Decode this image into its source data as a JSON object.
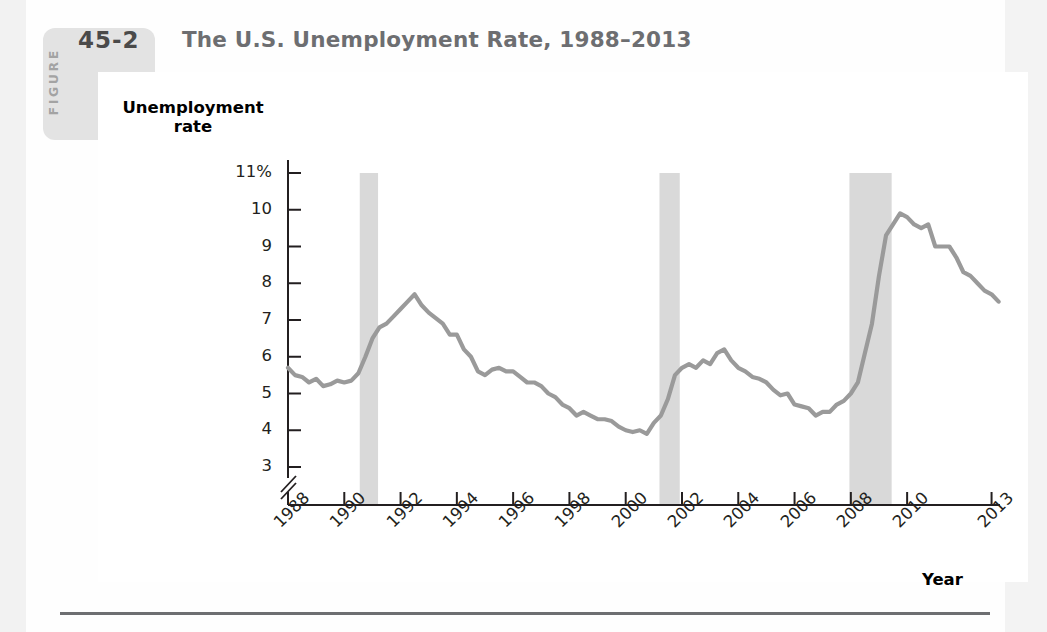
{
  "figure": {
    "label_word": "FIGURE",
    "number": "45-2",
    "title": "The U.S. Unemployment Rate, 1988–2013"
  },
  "chart_data": {
    "type": "line",
    "title": "The U.S. Unemployment Rate, 1988–2013",
    "xlabel": "Year",
    "ylabel": "Unemployment rate",
    "ylabel_lines": [
      "Unemployment",
      "rate"
    ],
    "grid": false,
    "legend": null,
    "axis_break_y": true,
    "ylim": [
      2.6,
      11.4
    ],
    "xlim": [
      1988.0,
      2013.3
    ],
    "yticks": [
      11,
      10,
      9,
      8,
      7,
      6,
      5,
      4,
      3
    ],
    "ytick_labels": [
      "11%",
      "10",
      "9",
      "8",
      "7",
      "6",
      "5",
      "4",
      "3"
    ],
    "xticks": [
      1988,
      1990,
      1992,
      1994,
      1996,
      1998,
      2000,
      2002,
      2004,
      2006,
      2008,
      2010,
      2013
    ],
    "xtick_labels": [
      "1988",
      "1990",
      "1992",
      "1994",
      "1996",
      "1998",
      "2000",
      "2002",
      "2004",
      "2006",
      "2008",
      "2010",
      "2013"
    ],
    "line_color": "#9a9a9a",
    "recession_band_color": "#d9d9d9",
    "recession_bands": [
      {
        "start": 1990.55,
        "end": 1991.2,
        "name": "1990-91 recession"
      },
      {
        "start": 2001.2,
        "end": 2001.92,
        "name": "2001 recession"
      },
      {
        "start": 2007.95,
        "end": 2009.45,
        "name": "2008-09 recession"
      }
    ],
    "series": [
      {
        "name": "U.S. unemployment rate",
        "x": [
          1988.0,
          1988.25,
          1988.5,
          1988.75,
          1989.0,
          1989.25,
          1989.5,
          1989.75,
          1990.0,
          1990.25,
          1990.5,
          1990.75,
          1991.0,
          1991.25,
          1991.5,
          1991.75,
          1992.0,
          1992.25,
          1992.5,
          1992.75,
          1993.0,
          1993.25,
          1993.5,
          1993.75,
          1994.0,
          1994.25,
          1994.5,
          1994.75,
          1995.0,
          1995.25,
          1995.5,
          1995.75,
          1996.0,
          1996.25,
          1996.5,
          1996.75,
          1997.0,
          1997.25,
          1997.5,
          1997.75,
          1998.0,
          1998.25,
          1998.5,
          1998.75,
          1999.0,
          1999.25,
          1999.5,
          1999.75,
          2000.0,
          2000.25,
          2000.5,
          2000.75,
          2001.0,
          2001.25,
          2001.5,
          2001.75,
          2002.0,
          2002.25,
          2002.5,
          2002.75,
          2003.0,
          2003.25,
          2003.5,
          2003.75,
          2004.0,
          2004.25,
          2004.5,
          2004.75,
          2005.0,
          2005.25,
          2005.5,
          2005.75,
          2006.0,
          2006.25,
          2006.5,
          2006.75,
          2007.0,
          2007.25,
          2007.5,
          2007.75,
          2008.0,
          2008.25,
          2008.5,
          2008.75,
          2009.0,
          2009.25,
          2009.5,
          2009.75,
          2010.0,
          2010.25,
          2010.5,
          2010.75,
          2011.0,
          2011.25,
          2011.5,
          2011.75,
          2012.0,
          2012.25,
          2012.5,
          2012.75,
          2013.0,
          2013.25
        ],
        "values": [
          5.7,
          5.5,
          5.45,
          5.3,
          5.4,
          5.2,
          5.25,
          5.35,
          5.3,
          5.35,
          5.55,
          6.0,
          6.5,
          6.8,
          6.9,
          7.1,
          7.3,
          7.5,
          7.7,
          7.4,
          7.2,
          7.05,
          6.9,
          6.6,
          6.6,
          6.2,
          6.0,
          5.6,
          5.5,
          5.65,
          5.7,
          5.6,
          5.6,
          5.45,
          5.3,
          5.3,
          5.2,
          5.0,
          4.9,
          4.7,
          4.6,
          4.4,
          4.5,
          4.4,
          4.3,
          4.3,
          4.25,
          4.1,
          4.0,
          3.95,
          4.0,
          3.9,
          4.2,
          4.4,
          4.85,
          5.5,
          5.7,
          5.8,
          5.7,
          5.9,
          5.8,
          6.1,
          6.2,
          5.9,
          5.7,
          5.6,
          5.45,
          5.4,
          5.3,
          5.1,
          4.95,
          5.0,
          4.7,
          4.65,
          4.6,
          4.4,
          4.5,
          4.5,
          4.7,
          4.8,
          5.0,
          5.3,
          6.1,
          6.9,
          8.2,
          9.3,
          9.6,
          9.9,
          9.8,
          9.6,
          9.5,
          9.6,
          9.0,
          9.0,
          9.0,
          8.7,
          8.3,
          8.2,
          8.0,
          7.8,
          7.7,
          7.5
        ]
      }
    ],
    "annotations": [
      {
        "text": "peak 7.8 in mid-1992"
      },
      {
        "text": "trough ~3.9 in 2000"
      },
      {
        "text": "peak 10.1 in late 2009"
      }
    ]
  }
}
